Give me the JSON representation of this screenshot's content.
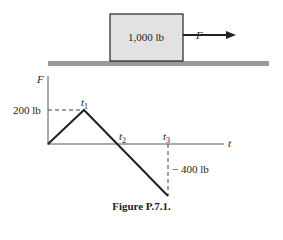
{
  "block": {
    "label": "1,000 lb",
    "fill": "#e2e2e2"
  },
  "force": {
    "label": "F"
  },
  "ground": {
    "color": "#9a9a9a"
  },
  "graph": {
    "y_axis_label": "F",
    "x_axis_label": "t",
    "y_ticks": [
      {
        "label": "200 lb",
        "value": 200
      },
      {
        "label": "− 400 lb",
        "value": -400
      }
    ],
    "points": [
      {
        "label": "",
        "t": 0,
        "F": 0
      },
      {
        "label": "t1",
        "t": 1,
        "F": 200
      },
      {
        "label": "t2",
        "t": 2,
        "F": 0
      },
      {
        "label": "t3",
        "t": 3,
        "F": -400
      }
    ],
    "t1": "t",
    "t1_sub": "1",
    "t2": "t",
    "t2_sub": "2",
    "t3": "t",
    "t3_sub": "3",
    "y_tick_200": "200 lb",
    "y_tick_neg400": "− 400 lb"
  },
  "caption": "Figure P.7.1."
}
